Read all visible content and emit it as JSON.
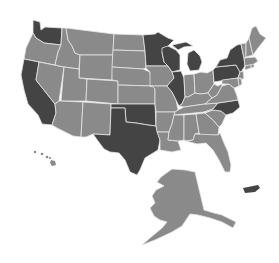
{
  "map": {
    "title": "",
    "colors": {
      "highlighted": "#444444",
      "default": "#8a8a8a",
      "border": "#e6e6e6",
      "background": "#ffffff"
    },
    "highlighted_states": [
      "WA",
      "CA",
      "MN",
      "WI",
      "IL",
      "MI",
      "NY",
      "PA",
      "NC",
      "TX",
      "OK",
      "PR"
    ],
    "default_states": [
      "OR",
      "ID",
      "MT",
      "WY",
      "NV",
      "UT",
      "CO",
      "AZ",
      "NM",
      "ND",
      "SD",
      "NE",
      "KS",
      "IA",
      "MO",
      "AR",
      "LA",
      "MS",
      "AL",
      "TN",
      "KY",
      "IN",
      "OH",
      "WV",
      "VA",
      "GA",
      "SC",
      "FL",
      "ME",
      "NH",
      "VT",
      "MA",
      "CT",
      "RI",
      "NJ",
      "DE",
      "MD",
      "AK",
      "HI"
    ]
  }
}
